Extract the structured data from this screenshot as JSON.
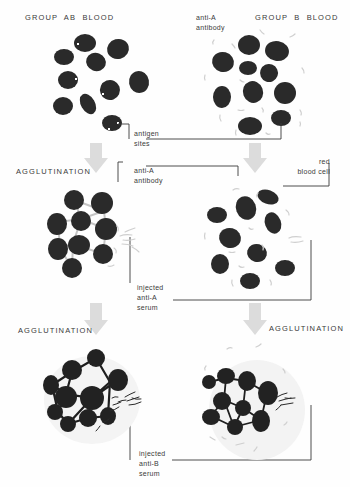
{
  "diagram": {
    "titles": {
      "group_ab": "GROUP  AB  BLOOD",
      "group_b": "GROUP  B  BLOOD",
      "agglutination_1": "AGGLUTINATION",
      "agglutination_2": "AGGLUTINATION",
      "agglutination_3": "AGGLUTINATION"
    },
    "labels": {
      "antigen_sites": "antigen\nsites",
      "anti_a_antibody_top": "anti-A\nantibody",
      "anti_a_antibody_mid": "anti-A\nantibody",
      "red_blood_cell": "red\nblood cell",
      "injected_anti_a": "injected\nanti-A\nserum",
      "injected_anti_b": "injected\nanti-B\nserum"
    },
    "panels": [
      {
        "id": "group-ab-blood",
        "state": "separate cells with antigen sites",
        "column": "left",
        "row": 1
      },
      {
        "id": "group-b-blood",
        "state": "separate cells with free anti-A antibody",
        "column": "right",
        "row": 1
      },
      {
        "id": "ab-after-anti-a",
        "state": "agglutinated (clumped)",
        "column": "left",
        "row": 2
      },
      {
        "id": "b-after-anti-a",
        "state": "not agglutinated",
        "column": "right",
        "row": 2
      },
      {
        "id": "ab-after-anti-b",
        "state": "agglutinated (dense)",
        "column": "left",
        "row": 3
      },
      {
        "id": "b-after-anti-b",
        "state": "agglutinated",
        "column": "right",
        "row": 3
      }
    ],
    "colors": {
      "cell": "#2a2a2a",
      "antibody": "#c8c8c8",
      "arrow": "#dadada",
      "line": "#3a3a3a",
      "text": "#3a3a3a"
    }
  }
}
